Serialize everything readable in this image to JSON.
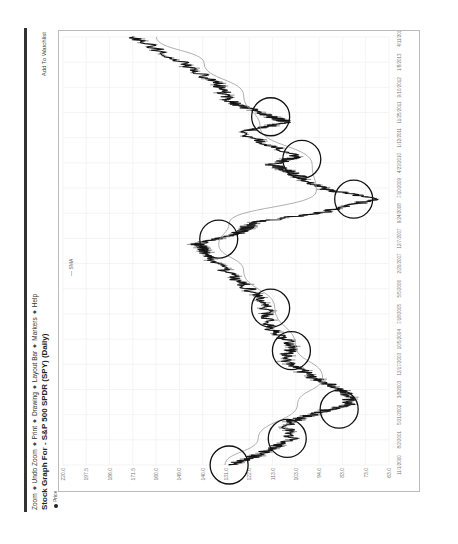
{
  "menu": {
    "items": [
      "Zoom",
      "Undo Zoom",
      "Print",
      "Drawing",
      "Layout Bar",
      "Markers",
      "Help"
    ]
  },
  "title": "Stock Graph For - S&P 500 SPDR (SPY) (Daily)",
  "add_to_watchlist": "Add To Watchlist",
  "legend": {
    "price_label": "Price",
    "sma_label": "SMA"
  },
  "chart_data": {
    "type": "line",
    "title": "Stock Graph For - S&P 500 SPDR (SPY) (Daily)",
    "xlabel": "",
    "ylabel": "",
    "grid": true,
    "legend_position": "top-left",
    "y_ticks": [
      "220.0",
      "197.5",
      "186.0",
      "171.5",
      "160.0",
      "149.0",
      "140.0",
      "131.0",
      "122.0",
      "113.0",
      "103.0",
      "94.0",
      "83.0",
      "73.0",
      "63.0"
    ],
    "x_ticks": [
      "11/1/2000",
      "8/2/2001",
      "5/21/2002",
      "3/8/2003",
      "12/17/2003",
      "10/5/2004",
      "7/18/2005",
      "5/5/2006",
      "2/20/2007",
      "12/7/2007",
      "9/24/2008",
      "7/10/2009",
      "4/23/2010",
      "1/12/2011",
      "11/25/2011",
      "9/10/2012",
      "1/8/2013",
      "4/11/2014"
    ],
    "ylim": [
      63,
      220
    ],
    "series": [
      {
        "name": "Price",
        "x": [
          "2000-11",
          "2001-03",
          "2001-09",
          "2002-03",
          "2002-07",
          "2002-10",
          "2003-03",
          "2003-08",
          "2004-03",
          "2004-08",
          "2005-03",
          "2005-10",
          "2006-05",
          "2006-12",
          "2007-07",
          "2007-10",
          "2008-03",
          "2008-06",
          "2008-10",
          "2009-03",
          "2009-07",
          "2010-01",
          "2010-04",
          "2010-07",
          "2011-04",
          "2011-08",
          "2011-11",
          "2012-04",
          "2012-10",
          "2013-06",
          "2014-04"
        ],
        "values": [
          140,
          125,
          110,
          112,
          96,
          82,
          84,
          100,
          114,
          109,
          121,
          122,
          130,
          142,
          152,
          155,
          133,
          130,
          95,
          70,
          95,
          110,
          120,
          107,
          135,
          112,
          124,
          140,
          145,
          162,
          186
        ]
      },
      {
        "name": "SMA",
        "x": [
          "2000-11",
          "2001-09",
          "2002-10",
          "2003-08",
          "2004-08",
          "2005-10",
          "2006-12",
          "2007-10",
          "2008-06",
          "2009-06",
          "2010-04",
          "2011-06",
          "2012-06",
          "2013-06",
          "2014-04"
        ],
        "values": [
          142,
          126,
          107,
          95,
          108,
          118,
          133,
          145,
          140,
          98,
          100,
          125,
          133,
          152,
          175
        ]
      }
    ],
    "annotations": [
      {
        "shape": "circle",
        "near_x": "2000-11",
        "approx_y": 140
      },
      {
        "shape": "circle",
        "near_x": "2001-09",
        "approx_y": 112
      },
      {
        "shape": "circle",
        "near_x": "2002-08",
        "approx_y": 87
      },
      {
        "shape": "circle",
        "near_x": "2004-06",
        "approx_y": 110
      },
      {
        "shape": "circle",
        "near_x": "2005-10",
        "approx_y": 120
      },
      {
        "shape": "circle",
        "near_x": "2007-12",
        "approx_y": 145
      },
      {
        "shape": "circle",
        "near_x": "2009-03",
        "approx_y": 80
      },
      {
        "shape": "circle",
        "near_x": "2010-06",
        "approx_y": 105
      },
      {
        "shape": "circle",
        "near_x": "2011-10",
        "approx_y": 120
      }
    ]
  }
}
